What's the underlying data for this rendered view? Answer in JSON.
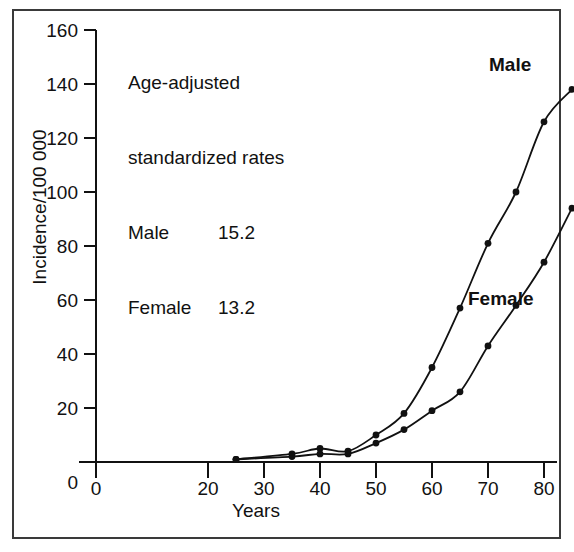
{
  "chart_data": {
    "type": "scatter",
    "title": "",
    "xlabel": "Years",
    "ylabel": "Incidence/100 000",
    "xlim": [
      0,
      88
    ],
    "ylim": [
      0,
      160
    ],
    "xticks": [
      0,
      20,
      30,
      40,
      50,
      60,
      70,
      80
    ],
    "yticks": [
      0,
      20,
      40,
      60,
      80,
      100,
      120,
      140,
      160
    ],
    "grid": false,
    "legend_position": "inline-curve-labels",
    "series": [
      {
        "name": "Male",
        "x": [
          25,
          35,
          40,
          45,
          50,
          55,
          60,
          65,
          70,
          75,
          80,
          85
        ],
        "values": [
          1,
          3,
          5,
          4,
          10,
          18,
          35,
          57,
          81,
          100,
          126,
          138
        ],
        "marker": "filled-circle",
        "line": "smooth-fitted-curve",
        "color": "#111111"
      },
      {
        "name": "Female",
        "x": [
          25,
          35,
          40,
          45,
          50,
          55,
          60,
          65,
          70,
          75,
          80,
          85
        ],
        "values": [
          1,
          2,
          3,
          3,
          7,
          12,
          19,
          26,
          43,
          58,
          74,
          94
        ],
        "marker": "filled-circle",
        "line": "smooth-fitted-curve",
        "color": "#111111"
      }
    ],
    "annotations": [
      {
        "text": "Age-adjusted"
      },
      {
        "text": "standardized rates"
      },
      {
        "name": "Male",
        "value": "15.2"
      },
      {
        "name": "Female",
        "value": "13.2"
      }
    ]
  },
  "annotation": {
    "line1": "Age-adjusted",
    "line2": "standardized rates",
    "male_name": "Male",
    "male_value": "15.2",
    "female_name": "Female",
    "female_value": "13.2"
  },
  "axes": {
    "ylabel": "Incidence/100 000",
    "xlabel": "Years",
    "ytick_labels": [
      "160",
      "140",
      "120",
      "100",
      "80",
      "60",
      "40",
      "20",
      "0"
    ],
    "xtick_labels": [
      "0",
      "20",
      "30",
      "40",
      "50",
      "60",
      "70",
      "80"
    ]
  },
  "curve_labels": {
    "male": "Male",
    "female": "Female"
  },
  "colors": {
    "ink": "#111111",
    "frame": "#3a3a3a",
    "background": "#ffffff"
  }
}
